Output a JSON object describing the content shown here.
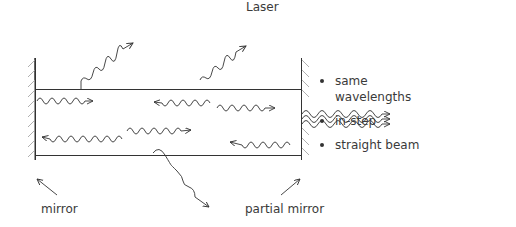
{
  "title": "Laser",
  "labels": {
    "mirror": "mirror",
    "partial_mirror": "partial mirror"
  },
  "properties": [
    {
      "text": "same wavelengths",
      "line1": "same",
      "line2": "wavelengths"
    },
    {
      "text": "in-step"
    },
    {
      "text": "straight beam"
    }
  ],
  "colors": {
    "line": "#333333",
    "hatch": "#9a9a9a",
    "text": "#3a3a3a"
  }
}
